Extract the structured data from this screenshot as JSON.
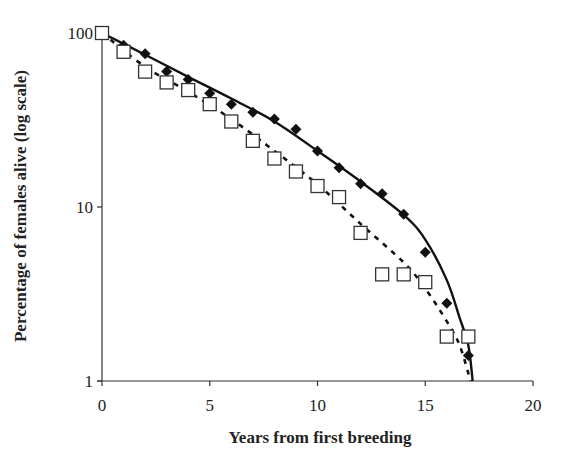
{
  "chart_data": {
    "type": "scatter",
    "title": "",
    "xlabel": "Years from first breeding",
    "ylabel": "Percentage of females alive (log scale)",
    "xlim": [
      0,
      20
    ],
    "ylim": [
      1,
      100
    ],
    "yscale": "log",
    "grid": false,
    "legend": null,
    "x_ticks": [
      0,
      5,
      10,
      15,
      20
    ],
    "x_tick_labels": [
      "0",
      "5",
      "10",
      "15",
      "20"
    ],
    "y_ticks": [
      1,
      10,
      100
    ],
    "y_tick_labels": [
      "1",
      "10",
      "100"
    ],
    "series": [
      {
        "name": "diamonds",
        "marker": "filled-diamond",
        "color": "#111111",
        "x": [
          1,
          2,
          3,
          4,
          5,
          6,
          7,
          8,
          9,
          10,
          11,
          12,
          13,
          14,
          15,
          16,
          17
        ],
        "y": [
          85,
          76,
          60,
          54,
          45,
          39,
          35,
          32,
          28,
          21,
          16.8,
          13.6,
          11.9,
          9.1,
          5.5,
          2.8,
          1.4
        ]
      },
      {
        "name": "squares",
        "marker": "open-square",
        "color": "#333333",
        "x": [
          0,
          1,
          2,
          3,
          4,
          5,
          6,
          7,
          8,
          9,
          10,
          11,
          12,
          13,
          14,
          15,
          16,
          17
        ],
        "y": [
          100,
          78,
          60,
          52,
          47,
          39,
          31,
          24,
          19,
          16,
          13.2,
          11.4,
          7.1,
          4.1,
          4.1,
          3.7,
          1.8,
          1.8
        ]
      }
    ],
    "fits": [
      {
        "name": "solid-fit",
        "style": "solid",
        "color": "#111111",
        "x": [
          0,
          2,
          4,
          6,
          8,
          10,
          12,
          14,
          15,
          16,
          16.6,
          17,
          17.2
        ],
        "y": [
          100,
          75,
          56,
          42,
          31,
          21,
          14,
          9,
          6.5,
          3.8,
          2.3,
          1.6,
          1
        ]
      },
      {
        "name": "dashed-fit",
        "style": "dashed",
        "color": "#111111",
        "x": [
          0,
          2,
          4,
          6,
          8,
          10,
          12,
          14,
          15,
          16,
          16.6,
          17.1
        ],
        "y": [
          100,
          64,
          46,
          32,
          21,
          13.5,
          8,
          4.8,
          3.4,
          2.2,
          1.6,
          1
        ]
      }
    ]
  }
}
